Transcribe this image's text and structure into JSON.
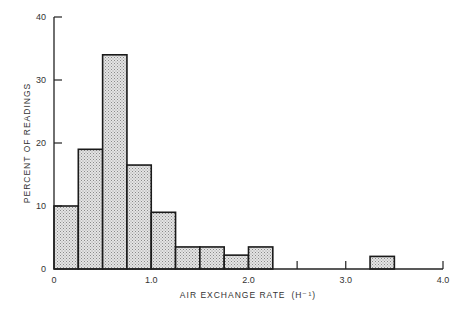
{
  "chart_data": {
    "type": "bar",
    "subtype": "histogram",
    "title": "",
    "xlabel": "AIR EXCHANGE RATE",
    "xlabel_unit": "(H⁻¹)",
    "ylabel": "PERCENT OF READINGS",
    "xlim": [
      0,
      4.0
    ],
    "ylim": [
      0,
      40
    ],
    "grid": false,
    "legend": null,
    "bin_width": 0.25,
    "bins": [
      {
        "x0": 0.0,
        "x1": 0.25,
        "value": 10
      },
      {
        "x0": 0.25,
        "x1": 0.5,
        "value": 19
      },
      {
        "x0": 0.5,
        "x1": 0.75,
        "value": 34
      },
      {
        "x0": 0.75,
        "x1": 1.0,
        "value": 16.5
      },
      {
        "x0": 1.0,
        "x1": 1.25,
        "value": 9
      },
      {
        "x0": 1.25,
        "x1": 1.5,
        "value": 3.5
      },
      {
        "x0": 1.5,
        "x1": 1.75,
        "value": 3.5
      },
      {
        "x0": 1.75,
        "x1": 2.0,
        "value": 2.2
      },
      {
        "x0": 2.0,
        "x1": 2.25,
        "value": 3.5
      },
      {
        "x0": 3.25,
        "x1": 3.5,
        "value": 2
      }
    ],
    "categories": [
      "0-0.25",
      "0.25-0.5",
      "0.5-0.75",
      "0.75-1.0",
      "1.0-1.25",
      "1.25-1.5",
      "1.5-1.75",
      "1.75-2.0",
      "2.0-2.25",
      "3.25-3.5"
    ],
    "values": [
      10,
      19,
      34,
      16.5,
      9,
      3.5,
      3.5,
      2.2,
      3.5,
      2
    ],
    "x_ticks": [
      {
        "value": 0,
        "label": "0"
      },
      {
        "value": 1.0,
        "label": "1.0"
      },
      {
        "value": 2.0,
        "label": "2.0"
      },
      {
        "value": 2.5,
        "label": ""
      },
      {
        "value": 3.0,
        "label": "3.0"
      },
      {
        "value": 4.0,
        "label": "4.0"
      }
    ],
    "y_ticks": [
      {
        "value": 0,
        "label": "0"
      },
      {
        "value": 10,
        "label": "10"
      },
      {
        "value": 20,
        "label": "20"
      },
      {
        "value": 30,
        "label": "30"
      },
      {
        "value": 40,
        "label": "40"
      }
    ],
    "style": {
      "bar_fill": "#d6d6d6",
      "bar_stroke": "#1a1a1a",
      "axis_color": "#222222"
    }
  }
}
